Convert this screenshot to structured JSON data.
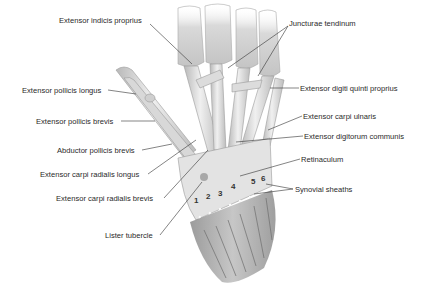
{
  "figure": {
    "labels": [
      {
        "id": "extensor-indicis-proprius",
        "text": "Extensor indicis proprius",
        "x": 59,
        "y": 20,
        "align": "left"
      },
      {
        "id": "juncturae-tendinum",
        "text": "Juncturae tendinum",
        "x": 289,
        "y": 23,
        "align": "left"
      },
      {
        "id": "extensor-pollicis-longus",
        "text": "Extensor pollicis longus",
        "x": 22,
        "y": 86,
        "align": "left"
      },
      {
        "id": "extensor-digiti-quinti-proprius",
        "text": "Extensor digiti quinti proprius",
        "x": 300,
        "y": 84,
        "align": "left"
      },
      {
        "id": "extensor-pollicis-brevis",
        "text": "Extensor pollicis brevis",
        "x": 36,
        "y": 117,
        "align": "left"
      },
      {
        "id": "extensor-carpi-ulnaris",
        "text": "Extensor carpi ulnaris",
        "x": 303,
        "y": 112,
        "align": "left"
      },
      {
        "id": "extensor-digitorum-communis",
        "text": "Extensor digitorum communis",
        "x": 304,
        "y": 132,
        "align": "left"
      },
      {
        "id": "abductor-pollicis-brevis",
        "text": "Abductor pollicis brevis",
        "x": 57,
        "y": 147,
        "align": "left"
      },
      {
        "id": "retinaculum",
        "text": "Retinaculum",
        "x": 301,
        "y": 155,
        "align": "left"
      },
      {
        "id": "extensor-carpi-radialis-longus",
        "text": "Extensor carpi radialis longus",
        "x": 40,
        "y": 171,
        "align": "left"
      },
      {
        "id": "synovial-sheaths",
        "text": "Synovial sheaths",
        "x": 295,
        "y": 185,
        "align": "left"
      },
      {
        "id": "extensor-carpi-radialis-brevis",
        "text": "Extensor carpi radialis brevis",
        "x": 56,
        "y": 195,
        "align": "left"
      },
      {
        "id": "lister-tubercle",
        "text": "Lister tubercle",
        "x": 105,
        "y": 232,
        "align": "left"
      }
    ],
    "compartment_numbers": [
      {
        "text": "1",
        "x": 194,
        "y": 196
      },
      {
        "text": "2",
        "x": 206,
        "y": 192
      },
      {
        "text": "3",
        "x": 218,
        "y": 189
      },
      {
        "text": "4",
        "x": 231,
        "y": 182
      },
      {
        "text": "5",
        "x": 251,
        "y": 177
      },
      {
        "text": "6",
        "x": 261,
        "y": 174
      }
    ],
    "colors": {
      "background": "#ffffff",
      "label_text": "#2a2a2a",
      "leader_line": "#333333",
      "tendon_light": "#e8e8e8",
      "tendon_mid": "#c8c8c8",
      "tendon_dark": "#9a9a9a",
      "retinaculum": "#e2e2e2"
    }
  }
}
